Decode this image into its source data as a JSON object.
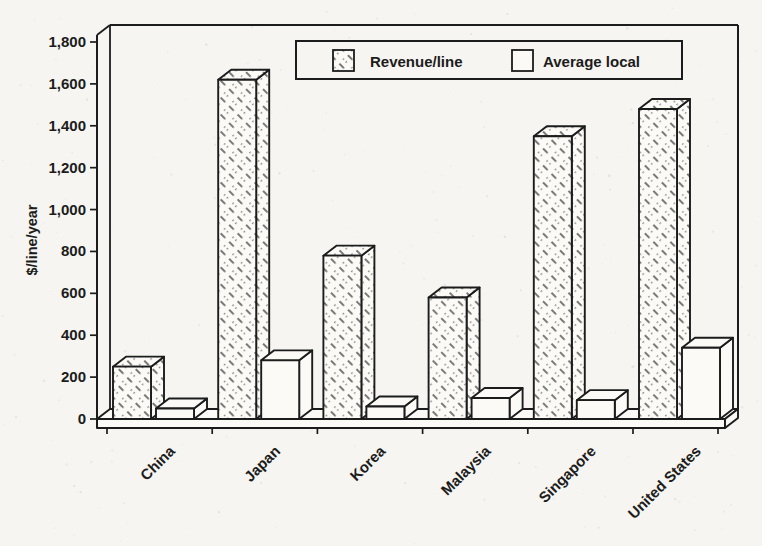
{
  "page": {
    "paper_color": "#f6f5f1",
    "ink_color": "#1c1c1c",
    "bar_face_color": "#fbfaf6"
  },
  "chart_data": {
    "type": "bar",
    "style": "monochrome-3d-scanned",
    "title": "",
    "xlabel": "",
    "ylabel": "$/line/year",
    "ylim": [
      0,
      1800
    ],
    "ytick_step": 200,
    "ytick_labels": [
      "0",
      "200",
      "400",
      "600",
      "800",
      "1,000",
      "1,200",
      "1,400",
      "1,600",
      "1,800"
    ],
    "categories": [
      "China",
      "Japan",
      "Korea",
      "Malaysia",
      "Singapore",
      "United States"
    ],
    "series": [
      {
        "name": "Revenue/line",
        "fill": "hatched",
        "values": [
          250,
          1620,
          780,
          580,
          1350,
          1480
        ]
      },
      {
        "name": "Average local",
        "fill": "white",
        "values": [
          50,
          280,
          60,
          100,
          90,
          340
        ]
      }
    ],
    "legend": {
      "position": "top-center",
      "entries": [
        {
          "label": "Revenue/line",
          "swatch": "hatched"
        },
        {
          "label": "Average local",
          "swatch": "white"
        }
      ]
    },
    "grid": false
  }
}
